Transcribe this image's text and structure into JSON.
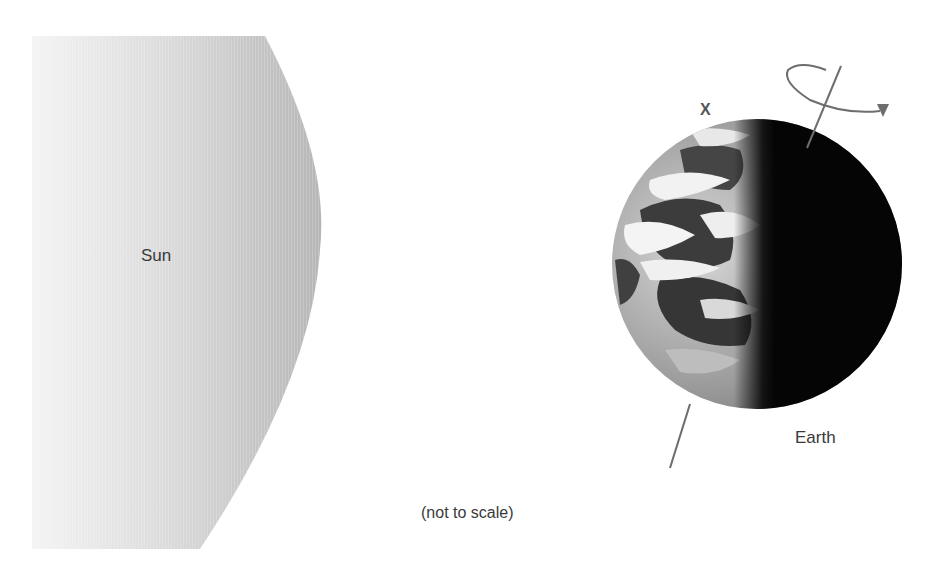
{
  "diagram": {
    "labels": {
      "sun": "Sun",
      "earth": "Earth",
      "point_marker": "X",
      "scale_note": "(not to scale)"
    },
    "bodies": [
      {
        "name": "Sun",
        "shape": "partial-disc",
        "fill_gradient": [
          "#f3f3f3",
          "#b8b8b8"
        ]
      },
      {
        "name": "Earth",
        "shape": "sphere",
        "center": [
          757,
          264
        ],
        "radius": 145,
        "day_side": "left",
        "night_side": "right",
        "terminator_x": 762
      }
    ],
    "annotations": [
      {
        "type": "rotation-axis",
        "from": [
          841,
          66
        ],
        "to": [
          670,
          468
        ],
        "color": "#6e6e6e"
      },
      {
        "type": "rotation-arrow",
        "direction": "counterclockwise-from-above",
        "color": "#6e6e6e"
      },
      {
        "type": "point-marker",
        "label": "X",
        "position": [
          705,
          110
        ]
      }
    ],
    "colors": {
      "sun_light": "#f5f5f5",
      "sun_dark": "#b5b5b5",
      "earth_night": "#050505",
      "line": "#6e6e6e",
      "text": "#3a3a3a"
    }
  }
}
